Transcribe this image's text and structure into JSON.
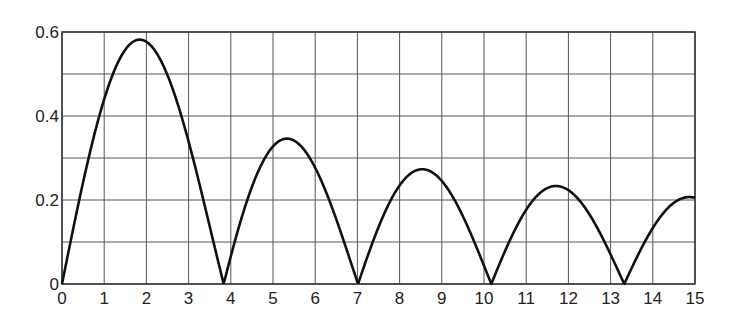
{
  "chart_data": {
    "type": "line",
    "title": "",
    "xlabel": "",
    "ylabel": "",
    "xlim": [
      0,
      15
    ],
    "ylim": [
      0,
      0.6
    ],
    "grid": true,
    "x_ticks": [
      "0",
      "1",
      "2",
      "3",
      "4",
      "5",
      "6",
      "7",
      "8",
      "9",
      "10",
      "11",
      "12",
      "13",
      "14",
      "15"
    ],
    "y_ticks": [
      "0",
      "0.2",
      "0.4",
      "0.6"
    ],
    "y_minor_grid_step": 0.1,
    "series": [
      {
        "name": "|J1(x)|",
        "x": [
          0,
          0.5,
          1,
          1.5,
          1.84,
          2,
          2.5,
          3,
          3.5,
          3.83,
          4,
          4.5,
          5,
          5.33,
          5.5,
          6,
          6.5,
          7.02,
          7.5,
          8,
          8.54,
          9,
          9.5,
          10.17,
          10.5,
          11,
          11.7,
          12,
          12.5,
          13.32,
          13.5,
          14,
          14.5,
          14.86,
          15
        ],
        "values": [
          0,
          0.242,
          0.44,
          0.558,
          0.582,
          0.577,
          0.497,
          0.339,
          0.138,
          0,
          0.066,
          0.231,
          0.328,
          0.346,
          0.341,
          0.277,
          0.154,
          0,
          0.135,
          0.235,
          0.273,
          0.245,
          0.161,
          0,
          0.071,
          0.177,
          0.25,
          0.223,
          0.135,
          0,
          0.038,
          0.133,
          0.19,
          0.205,
          0.205
        ]
      }
    ]
  }
}
